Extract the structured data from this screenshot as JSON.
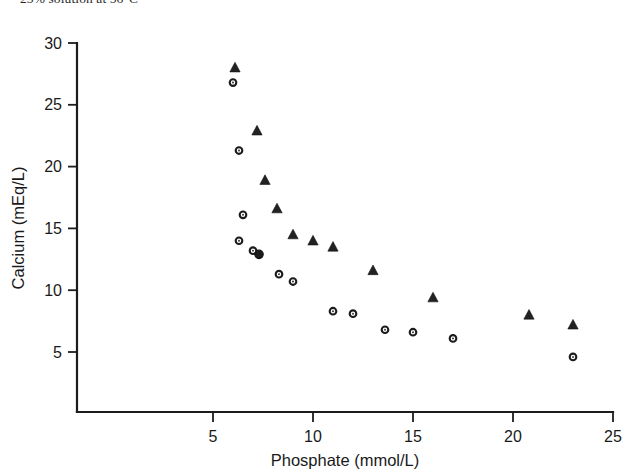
{
  "caption": {
    "text": "25% solution at 56°C"
  },
  "chart_data": {
    "type": "scatter",
    "title": "",
    "xlabel": "Phosphate (mmol/L)",
    "ylabel": "Calcium (mEq/L)",
    "xlim": [
      0,
      25
    ],
    "ylim": [
      0,
      30
    ],
    "xticks": [
      5,
      10,
      15,
      20,
      25
    ],
    "yticks": [
      5,
      10,
      15,
      20,
      25,
      30
    ],
    "xtick_labels": [
      "5",
      "10",
      "15",
      "20",
      "25"
    ],
    "ytick_labels": [
      "5",
      "10",
      "15",
      "20",
      "25",
      "30"
    ],
    "grid": false,
    "legend": "none",
    "axis_origin": [
      0,
      0
    ],
    "series": [
      {
        "name": "triangles",
        "marker": "filled-triangle",
        "color": "#222222",
        "points": [
          {
            "x": 6.1,
            "y": 28.0
          },
          {
            "x": 7.2,
            "y": 22.9
          },
          {
            "x": 7.6,
            "y": 18.9
          },
          {
            "x": 8.2,
            "y": 16.6
          },
          {
            "x": 9.0,
            "y": 14.5
          },
          {
            "x": 10.0,
            "y": 14.0
          },
          {
            "x": 11.0,
            "y": 13.5
          },
          {
            "x": 13.0,
            "y": 11.6
          },
          {
            "x": 16.0,
            "y": 9.4
          },
          {
            "x": 20.8,
            "y": 8.0
          },
          {
            "x": 23.0,
            "y": 7.2
          }
        ]
      },
      {
        "name": "open-circles",
        "marker": "open-circle",
        "color": "#1b1b1b",
        "points": [
          {
            "x": 6.0,
            "y": 26.8
          },
          {
            "x": 6.3,
            "y": 21.3
          },
          {
            "x": 6.5,
            "y": 16.1
          },
          {
            "x": 6.3,
            "y": 14.0
          },
          {
            "x": 7.0,
            "y": 13.2
          },
          {
            "x": 8.3,
            "y": 11.3
          },
          {
            "x": 9.0,
            "y": 10.7
          },
          {
            "x": 11.0,
            "y": 8.3
          },
          {
            "x": 12.0,
            "y": 8.1
          },
          {
            "x": 13.6,
            "y": 6.8
          },
          {
            "x": 15.0,
            "y": 6.6
          },
          {
            "x": 17.0,
            "y": 6.1
          },
          {
            "x": 23.0,
            "y": 4.6
          }
        ]
      },
      {
        "name": "filled-circles",
        "marker": "filled-circle",
        "color": "#1b1b1b",
        "points": [
          {
            "x": 7.3,
            "y": 12.9
          }
        ]
      }
    ]
  }
}
